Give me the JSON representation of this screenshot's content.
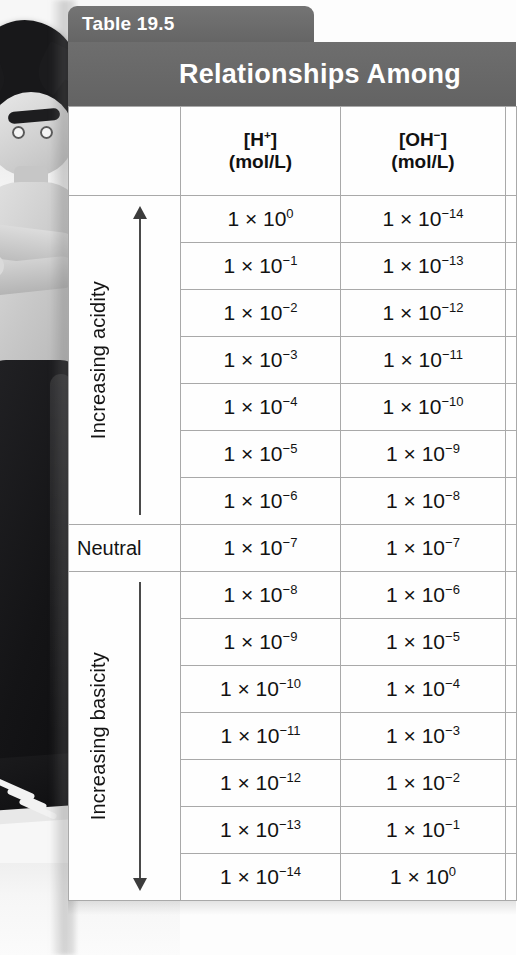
{
  "table": {
    "tab_label": "Table 19.5",
    "title": "Relationships Among",
    "headers": {
      "label_col": "",
      "h_line1": "[H+]",
      "h_line2": "(mol/L)",
      "oh_line1": "[OH−]",
      "oh_line2": "(mol/L)"
    },
    "side_labels": {
      "acidity": "Increasing acidity",
      "neutral": "Neutral",
      "basicity": "Increasing basicity"
    },
    "rows": [
      {
        "h_mantissa": "1 × 10",
        "h_exp": "0",
        "oh_mantissa": "1 × 10",
        "oh_exp": "−14"
      },
      {
        "h_mantissa": "1 × 10",
        "h_exp": "−1",
        "oh_mantissa": "1 × 10",
        "oh_exp": "−13"
      },
      {
        "h_mantissa": "1 × 10",
        "h_exp": "−2",
        "oh_mantissa": "1 × 10",
        "oh_exp": "−12"
      },
      {
        "h_mantissa": "1 × 10",
        "h_exp": "−3",
        "oh_mantissa": "1 × 10",
        "oh_exp": "−11"
      },
      {
        "h_mantissa": "1 × 10",
        "h_exp": "−4",
        "oh_mantissa": "1 × 10",
        "oh_exp": "−10"
      },
      {
        "h_mantissa": "1 × 10",
        "h_exp": "−5",
        "oh_mantissa": "1 × 10",
        "oh_exp": "−9"
      },
      {
        "h_mantissa": "1 × 10",
        "h_exp": "−6",
        "oh_mantissa": "1 × 10",
        "oh_exp": "−8"
      },
      {
        "h_mantissa": "1 × 10",
        "h_exp": "−7",
        "oh_mantissa": "1 × 10",
        "oh_exp": "−7"
      },
      {
        "h_mantissa": "1 × 10",
        "h_exp": "−8",
        "oh_mantissa": "1 × 10",
        "oh_exp": "−6"
      },
      {
        "h_mantissa": "1 × 10",
        "h_exp": "−9",
        "oh_mantissa": "1 × 10",
        "oh_exp": "−5"
      },
      {
        "h_mantissa": "1 × 10",
        "h_exp": "−10",
        "oh_mantissa": "1 × 10",
        "oh_exp": "−4"
      },
      {
        "h_mantissa": "1 × 10",
        "h_exp": "−11",
        "oh_mantissa": "1 × 10",
        "oh_exp": "−3"
      },
      {
        "h_mantissa": "1 × 10",
        "h_exp": "−12",
        "oh_mantissa": "1 × 10",
        "oh_exp": "−2"
      },
      {
        "h_mantissa": "1 × 10",
        "h_exp": "−13",
        "oh_mantissa": "1 × 10",
        "oh_exp": "−1"
      },
      {
        "h_mantissa": "1 × 10",
        "h_exp": "−14",
        "oh_mantissa": "1 × 10",
        "oh_exp": "0"
      }
    ]
  },
  "photo": {
    "subject": "cartoon-boy-figure"
  },
  "colors": {
    "header_gray": "#6b6b6b",
    "tab_gray": "#6e6e6e",
    "grid_line": "#a9a9a9",
    "text_dark": "#121212",
    "header_text": "#ffffff"
  }
}
